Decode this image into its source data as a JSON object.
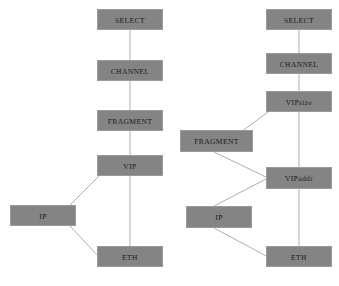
{
  "figure": {
    "background_color": "#ffffff",
    "node_fill_color": "#848484",
    "node_border_color": "#9a9a9a",
    "edge_color": "#b0b0b0",
    "label_color": "#1d1d1d"
  },
  "diagrams": [
    {
      "id": "left-diagram",
      "name": "vip-stack-left",
      "nodes": [
        {
          "id": "l-select",
          "label": "SELECT",
          "x": 97,
          "y": 9,
          "w": 66,
          "h": 21
        },
        {
          "id": "l-channel",
          "label": "CHANNEL",
          "x": 97,
          "y": 60,
          "w": 66,
          "h": 21
        },
        {
          "id": "l-fragment",
          "label": "FRAGMENT",
          "x": 97,
          "y": 110,
          "w": 66,
          "h": 21
        },
        {
          "id": "l-vip",
          "label": "VIP",
          "x": 97,
          "y": 155,
          "w": 66,
          "h": 21
        },
        {
          "id": "l-ip",
          "label": "IP",
          "x": 10,
          "y": 205,
          "w": 66,
          "h": 21
        },
        {
          "id": "l-eth",
          "label": "ETH",
          "x": 97,
          "y": 246,
          "w": 66,
          "h": 21
        }
      ],
      "edges": [
        {
          "from": "l-select",
          "to": "l-channel",
          "x1": 130,
          "y1": 30,
          "x2": 130,
          "y2": 60
        },
        {
          "from": "l-channel",
          "to": "l-fragment",
          "x1": 130,
          "y1": 81,
          "x2": 130,
          "y2": 110
        },
        {
          "from": "l-fragment",
          "to": "l-vip",
          "x1": 130,
          "y1": 131,
          "x2": 130,
          "y2": 155
        },
        {
          "from": "l-vip",
          "to": "l-eth",
          "x1": 130,
          "y1": 176,
          "x2": 130,
          "y2": 246
        },
        {
          "from": "l-ip",
          "to": "l-vip",
          "x1": 70,
          "y1": 205,
          "x2": 99,
          "y2": 176
        },
        {
          "from": "l-ip",
          "to": "l-eth",
          "x1": 70,
          "y1": 226,
          "x2": 99,
          "y2": 257
        }
      ]
    },
    {
      "id": "right-diagram",
      "name": "vip-stack-right",
      "nodes": [
        {
          "id": "r-select",
          "label": "SELECT",
          "x": 266,
          "y": 9,
          "w": 66,
          "h": 21
        },
        {
          "id": "r-channel",
          "label": "CHANNEL",
          "x": 266,
          "y": 53,
          "w": 66,
          "h": 21
        },
        {
          "id": "r-vipsize",
          "label": "VIPsize",
          "x": 266,
          "y": 91,
          "w": 66,
          "h": 21
        },
        {
          "id": "r-fragment",
          "label": "FRAGMENT",
          "x": 180,
          "y": 130,
          "w": 73,
          "h": 22
        },
        {
          "id": "r-vipaddr",
          "label": "VIPaddr",
          "x": 266,
          "y": 167,
          "w": 66,
          "h": 22
        },
        {
          "id": "r-ip",
          "label": "IP",
          "x": 186,
          "y": 206,
          "w": 66,
          "h": 22
        },
        {
          "id": "r-eth",
          "label": "ETH",
          "x": 266,
          "y": 246,
          "w": 66,
          "h": 21
        }
      ],
      "edges": [
        {
          "from": "r-select",
          "to": "r-channel",
          "x1": 299,
          "y1": 30,
          "x2": 299,
          "y2": 53
        },
        {
          "from": "r-channel",
          "to": "r-vipsize",
          "x1": 299,
          "y1": 74,
          "x2": 299,
          "y2": 91
        },
        {
          "from": "r-vipsize",
          "to": "r-fragment",
          "x1": 268,
          "y1": 112,
          "x2": 214,
          "y2": 152
        },
        {
          "from": "r-vipsize",
          "to": "r-eth",
          "x1": 299,
          "y1": 112,
          "x2": 299,
          "y2": 246
        },
        {
          "from": "r-fragment",
          "to": "r-vipaddr",
          "x1": 214,
          "y1": 152,
          "x2": 268,
          "y2": 178
        },
        {
          "from": "r-ip",
          "to": "r-vipaddr",
          "x1": 214,
          "y1": 206,
          "x2": 268,
          "y2": 178
        },
        {
          "from": "r-ip",
          "to": "r-eth",
          "x1": 214,
          "y1": 228,
          "x2": 268,
          "y2": 257
        }
      ]
    }
  ]
}
